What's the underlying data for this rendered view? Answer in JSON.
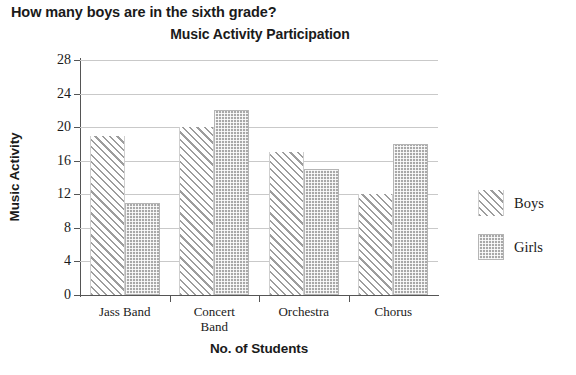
{
  "question": "How many boys are in the sixth grade?",
  "chart_data": {
    "type": "bar",
    "title": "Music Activity Participation",
    "xlabel": "No. of Students",
    "ylabel": "Music Activity",
    "categories": [
      "Jass Band",
      "Concert Band",
      "Orchestra",
      "Chorus"
    ],
    "category_lines": [
      [
        "Jass Band"
      ],
      [
        "Concert",
        "Band"
      ],
      [
        "Orchestra"
      ],
      [
        "Chorus"
      ]
    ],
    "series": [
      {
        "name": "Boys",
        "values": [
          19,
          20,
          17,
          12
        ],
        "fill": "diagonal-hatch",
        "color": "#9d9d9d"
      },
      {
        "name": "Girls",
        "values": [
          11,
          22,
          15,
          18
        ],
        "fill": "dotted-stipple",
        "color": "#a8a8a8"
      }
    ],
    "ylim": [
      0,
      28
    ],
    "yticks": [
      0,
      4,
      8,
      12,
      16,
      20,
      24,
      28
    ],
    "ytick_labels": [
      "0",
      "4",
      "8",
      "12",
      "16",
      "20",
      "24",
      "28"
    ],
    "grid": true,
    "grid_axis": "y",
    "legend_position": "right",
    "legend": [
      "Boys",
      "Girls"
    ]
  }
}
